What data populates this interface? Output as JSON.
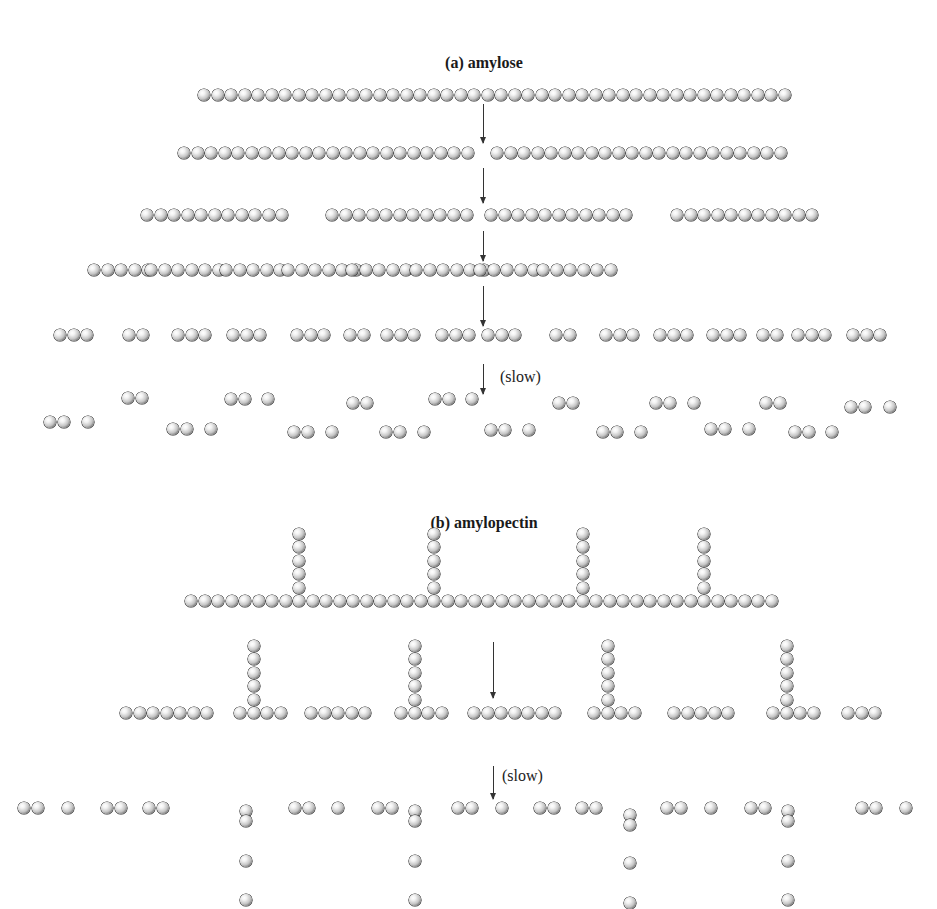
{
  "figure": {
    "panel_a": {
      "title": "(a) amylose",
      "slow_label": "(slow)",
      "rows": [
        {
          "y": 95,
          "groups": [
            {
              "x": 198,
              "n": 44
            }
          ]
        },
        {
          "y": 153,
          "groups": [
            {
              "x": 178,
              "n": 22
            },
            {
              "x": 491,
              "n": 22
            }
          ]
        },
        {
          "y": 215,
          "groups": [
            {
              "x": 141,
              "n": 11
            },
            {
              "x": 326,
              "n": 11
            },
            {
              "x": 485,
              "n": 11
            },
            {
              "x": 671,
              "n": 11
            }
          ]
        },
        {
          "y": 270,
          "groups": [
            {
              "x": 88,
              "n": 5
            },
            {
              "x": 145,
              "n": 6
            },
            {
              "x": 220,
              "n": 5
            },
            {
              "x": 282,
              "n": 6
            },
            {
              "x": 346,
              "n": 5
            },
            {
              "x": 410,
              "n": 6
            },
            {
              "x": 474,
              "n": 5
            },
            {
              "x": 537,
              "n": 6
            }
          ]
        },
        {
          "y": 335,
          "groups": [
            {
              "x": 54,
              "n": 3
            },
            {
              "x": 123,
              "n": 2
            },
            {
              "x": 172,
              "n": 3
            },
            {
              "x": 227,
              "n": 3
            },
            {
              "x": 291,
              "n": 3
            },
            {
              "x": 344,
              "n": 2
            },
            {
              "x": 381,
              "n": 3
            },
            {
              "x": 436,
              "n": 3
            },
            {
              "x": 482,
              "n": 3
            },
            {
              "x": 550,
              "n": 2
            },
            {
              "x": 600,
              "n": 3
            },
            {
              "x": 654,
              "n": 3
            },
            {
              "x": 707,
              "n": 3
            },
            {
              "x": 757,
              "n": 2
            },
            {
              "x": 792,
              "n": 3
            },
            {
              "x": 847,
              "n": 3
            }
          ]
        }
      ],
      "scatter": [
        {
          "x": 44,
          "y": 422,
          "n": 2
        },
        {
          "x": 82,
          "y": 422,
          "n": 1
        },
        {
          "x": 122,
          "y": 398,
          "n": 2
        },
        {
          "x": 167,
          "y": 429,
          "n": 2
        },
        {
          "x": 205,
          "y": 429,
          "n": 1
        },
        {
          "x": 225,
          "y": 399,
          "n": 2
        },
        {
          "x": 262,
          "y": 399,
          "n": 1
        },
        {
          "x": 288,
          "y": 432,
          "n": 2
        },
        {
          "x": 326,
          "y": 432,
          "n": 1
        },
        {
          "x": 347,
          "y": 403,
          "n": 2
        },
        {
          "x": 380,
          "y": 432,
          "n": 2
        },
        {
          "x": 418,
          "y": 432,
          "n": 1
        },
        {
          "x": 429,
          "y": 399,
          "n": 2
        },
        {
          "x": 466,
          "y": 399,
          "n": 1
        },
        {
          "x": 485,
          "y": 430,
          "n": 2
        },
        {
          "x": 523,
          "y": 430,
          "n": 1
        },
        {
          "x": 553,
          "y": 403,
          "n": 2
        },
        {
          "x": 597,
          "y": 432,
          "n": 2
        },
        {
          "x": 635,
          "y": 432,
          "n": 1
        },
        {
          "x": 650,
          "y": 403,
          "n": 2
        },
        {
          "x": 688,
          "y": 403,
          "n": 1
        },
        {
          "x": 705,
          "y": 429,
          "n": 2
        },
        {
          "x": 743,
          "y": 429,
          "n": 1
        },
        {
          "x": 760,
          "y": 403,
          "n": 2
        },
        {
          "x": 789,
          "y": 432,
          "n": 2
        },
        {
          "x": 826,
          "y": 432,
          "n": 1
        },
        {
          "x": 845,
          "y": 407,
          "n": 2
        },
        {
          "x": 884,
          "y": 407,
          "n": 1
        }
      ],
      "arrows": [
        {
          "x": 483,
          "y1": 104,
          "y2": 143
        },
        {
          "x": 483,
          "y1": 168,
          "y2": 203
        },
        {
          "x": 483,
          "y1": 231,
          "y2": 261
        },
        {
          "x": 483,
          "y1": 286,
          "y2": 326
        },
        {
          "x": 483,
          "y1": 364,
          "y2": 394
        }
      ],
      "slow_pos": {
        "x": 500,
        "y": 368
      }
    },
    "panel_b": {
      "title": "(b) amylopectin",
      "slow_label": "(slow)",
      "main_chain": {
        "x": 185,
        "y": 601,
        "n": 44,
        "branches": [
          {
            "index": 8,
            "len": 5
          },
          {
            "index": 18,
            "len": 5
          },
          {
            "index": 29,
            "len": 5
          },
          {
            "index": 38,
            "len": 5
          }
        ]
      },
      "row2": {
        "y": 713,
        "groups": [
          {
            "x": 120,
            "n": 7
          },
          {
            "x": 234,
            "n": 4,
            "branch_index": 1,
            "branch_len": 5
          },
          {
            "x": 305,
            "n": 5
          },
          {
            "x": 395,
            "n": 4,
            "branch_index": 1,
            "branch_len": 5
          },
          {
            "x": 468,
            "n": 7
          },
          {
            "x": 588,
            "n": 4,
            "branch_index": 1,
            "branch_len": 5
          },
          {
            "x": 668,
            "n": 5
          },
          {
            "x": 767,
            "n": 4,
            "branch_index": 1,
            "branch_len": 5
          },
          {
            "x": 842,
            "n": 3
          }
        ]
      },
      "scatter": [
        {
          "x": 18,
          "y": 808,
          "n": 2
        },
        {
          "x": 62,
          "y": 808,
          "n": 1
        },
        {
          "x": 101,
          "y": 808,
          "n": 2
        },
        {
          "x": 143,
          "y": 808,
          "n": 2
        },
        {
          "x": 289,
          "y": 808,
          "n": 2
        },
        {
          "x": 332,
          "y": 808,
          "n": 1
        },
        {
          "x": 372,
          "y": 808,
          "n": 2
        },
        {
          "x": 452,
          "y": 808,
          "n": 2
        },
        {
          "x": 496,
          "y": 808,
          "n": 1
        },
        {
          "x": 534,
          "y": 808,
          "n": 2
        },
        {
          "x": 576,
          "y": 808,
          "n": 2
        },
        {
          "x": 661,
          "y": 808,
          "n": 2
        },
        {
          "x": 705,
          "y": 808,
          "n": 1
        },
        {
          "x": 745,
          "y": 808,
          "n": 2
        },
        {
          "x": 856,
          "y": 808,
          "n": 2
        },
        {
          "x": 900,
          "y": 808,
          "n": 1
        }
      ],
      "stacks": [
        {
          "x": 246,
          "y": 811,
          "n": 2
        },
        {
          "x": 246,
          "y": 861,
          "n": 1
        },
        {
          "x": 246,
          "y": 900,
          "n": 1
        },
        {
          "x": 415,
          "y": 811,
          "n": 2
        },
        {
          "x": 415,
          "y": 861,
          "n": 1
        },
        {
          "x": 415,
          "y": 900,
          "n": 1
        },
        {
          "x": 630,
          "y": 815,
          "n": 2
        },
        {
          "x": 630,
          "y": 863,
          "n": 1
        },
        {
          "x": 630,
          "y": 903,
          "n": 1
        },
        {
          "x": 788,
          "y": 811,
          "n": 2
        },
        {
          "x": 788,
          "y": 861,
          "n": 1
        },
        {
          "x": 788,
          "y": 900,
          "n": 1
        }
      ],
      "arrows": [
        {
          "x": 493,
          "y1": 642,
          "y2": 698
        },
        {
          "x": 493,
          "y1": 766,
          "y2": 799
        }
      ],
      "slow_pos": {
        "x": 502,
        "y": 767
      }
    }
  }
}
